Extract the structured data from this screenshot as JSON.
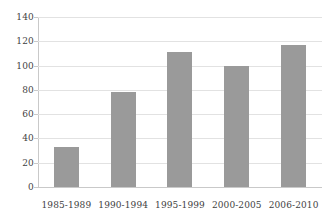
{
  "chart_data": {
    "type": "bar",
    "title": "",
    "subtitle": "",
    "xlabel": "",
    "ylabel": "",
    "categories": [
      "1985-1989",
      "1990-1994",
      "1995-1999",
      "2000-2005",
      "2006-2010"
    ],
    "values": [
      33,
      78,
      111,
      100,
      117
    ],
    "series": [
      {
        "name": "",
        "values": [
          33,
          78,
          111,
          100,
          117
        ]
      }
    ],
    "ylim": [
      0,
      140
    ],
    "yticks": [
      0,
      20,
      40,
      60,
      80,
      100,
      120,
      140
    ],
    "ytick_labels": [
      "0",
      "20",
      "40",
      "60",
      "80",
      "100",
      "120",
      "140"
    ],
    "grid": true,
    "grid_axis": "y",
    "legend": false,
    "legend_position": "none",
    "bar_color": "#9a9a9a",
    "gridline_color": "#e2e2e2",
    "axis_color": "#c9c9c9",
    "text_color": "#3f3f3f",
    "background_color": "#ffffff"
  }
}
